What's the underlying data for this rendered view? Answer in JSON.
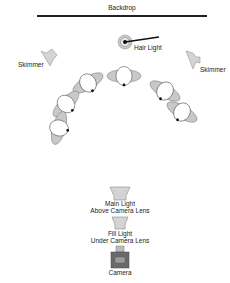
{
  "diagram": {
    "type": "lighting-setup",
    "labels": {
      "backdrop": "Backdrop",
      "hair_light": "Hair Light",
      "skimmer_left": "Skimmer",
      "skimmer_right": "Skimmer",
      "main_light_line1": "Main Light",
      "main_light_line2": "Above Camera Lens",
      "fill_light_line1": "Fill Light",
      "fill_light_line2": "Under Camera Lens",
      "camera": "Camera"
    },
    "subjects_count": 6,
    "colors": {
      "line": "#222222",
      "fill_gray": "#c8c8c8",
      "stroke_gray": "#8a8a8a",
      "camera_dark": "#6a6a6a",
      "camera_mid": "#9a9a9a"
    }
  }
}
